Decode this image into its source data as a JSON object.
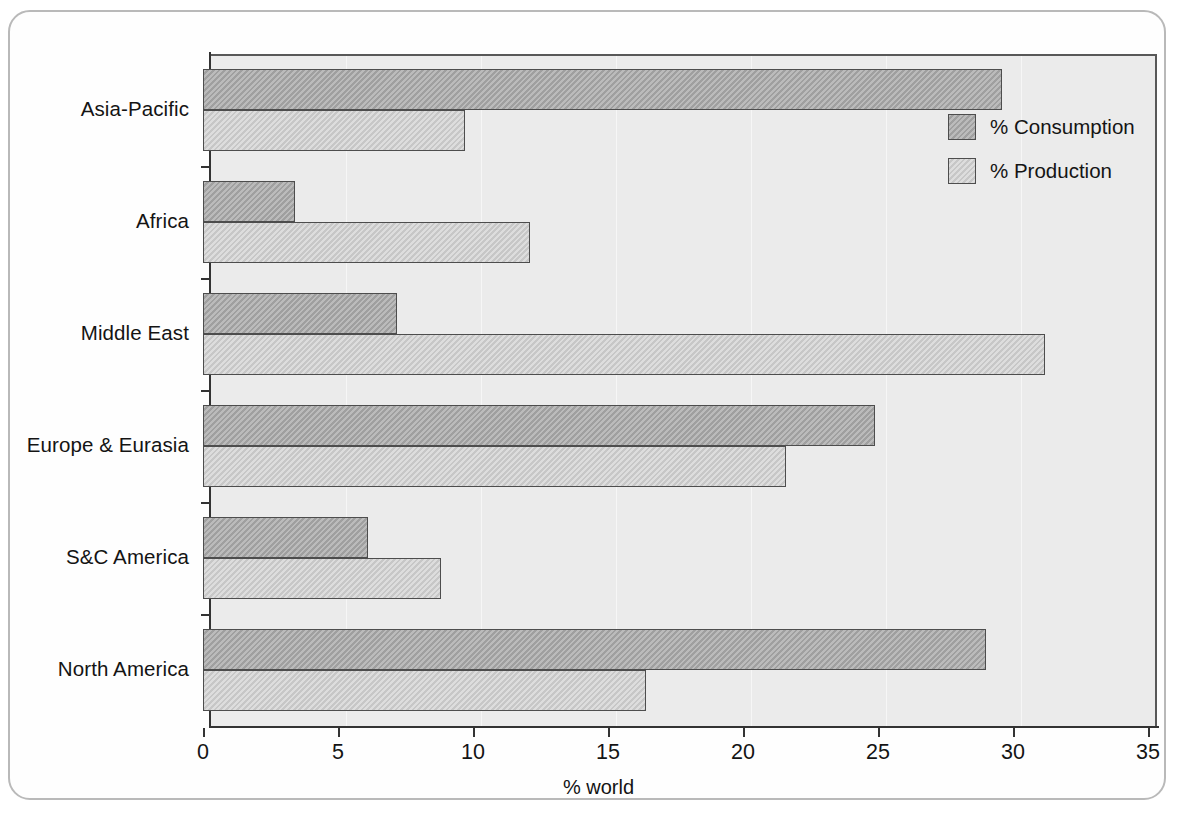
{
  "chart_data": {
    "type": "bar",
    "orientation": "horizontal",
    "title": "",
    "xlabel": "% world",
    "ylabel": "",
    "xlim": [
      0,
      35
    ],
    "xticks": [
      0,
      5,
      10,
      15,
      20,
      25,
      30,
      35
    ],
    "xtick_labels": [
      "0",
      "5",
      "10",
      "15",
      "20",
      "25",
      "30",
      "35"
    ],
    "grid": false,
    "legend_position": "top-right",
    "categories": [
      "Asia-Pacific",
      "Africa",
      "Middle East",
      "Europe & Eurasia",
      "S&C America",
      "North America"
    ],
    "series": [
      {
        "name": "% Consumption",
        "color": "#a8a8a8",
        "values": [
          29.6,
          3.4,
          7.2,
          24.9,
          6.1,
          29.0
        ]
      },
      {
        "name": "% Production",
        "color": "#cfcfcf",
        "values": [
          9.7,
          12.1,
          31.2,
          21.6,
          8.8,
          16.4
        ]
      }
    ]
  },
  "legend": {
    "items": [
      {
        "label": "% Consumption",
        "swatch": "consumption-swatch"
      },
      {
        "label": "% Production",
        "swatch": "production-swatch"
      }
    ]
  },
  "axis": {
    "x_title": "% world"
  }
}
